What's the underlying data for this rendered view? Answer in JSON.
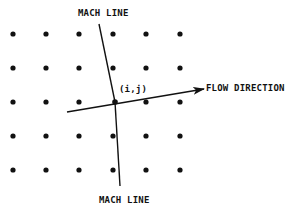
{
  "labels": {
    "mach_line_top": "MACH LINE",
    "mach_line_bottom": "MACH LINE",
    "flow_direction": "FLOW DIRECTION",
    "grid_point": "(i,j)"
  },
  "colors": {
    "ink": "#111111",
    "background": "#ffffff"
  },
  "grid": {
    "columns_x": [
      13,
      46,
      79,
      113,
      146,
      180
    ],
    "rows_y": [
      34,
      68,
      102,
      136,
      170
    ],
    "dot_radius": 2.6
  },
  "center_point": {
    "x": 115,
    "y": 102
  }
}
